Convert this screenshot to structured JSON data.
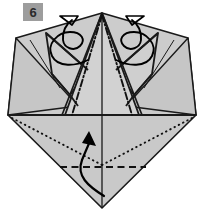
{
  "diagram": {
    "step_number": "6",
    "step_badge_color": "#9d9d9d",
    "paper_fill": "#c9c9c9",
    "paper_fill_light": "#d4d4d4",
    "paper_fill_dark": "#bdbdbd",
    "line_color": "#1a1a1a",
    "background": "#ffffff",
    "legend": {
      "mountain_fold": "dash-dot line",
      "valley_fold": "dashed line",
      "hidden_edge": "dotted line",
      "paper_edge": "solid line"
    },
    "annotations": [
      {
        "name": "curl-arrow-left",
        "type": "curved-arrow",
        "description": "Looping arrow at upper left indicating outward curl of left flap",
        "direction": "counter-clockwise-outward"
      },
      {
        "name": "curl-arrow-right",
        "type": "curved-arrow",
        "description": "Looping arrow at upper right indicating outward curl of right flap",
        "direction": "clockwise-outward"
      },
      {
        "name": "fold-up-arrow",
        "type": "curved-arrow",
        "description": "Curved arrow in lower diamond indicating fold bottom flap upward",
        "direction": "upward"
      }
    ],
    "fold_lines": [
      {
        "name": "center-vertical-line",
        "style": "solid"
      },
      {
        "name": "mountain-fold-left",
        "style": "dash-dot"
      },
      {
        "name": "mountain-fold-right",
        "style": "dash-dot"
      },
      {
        "name": "horizontal-midline",
        "style": "solid"
      },
      {
        "name": "valley-fold-horizontal",
        "style": "dashed"
      },
      {
        "name": "hidden-edge-left",
        "style": "dotted"
      },
      {
        "name": "hidden-edge-right",
        "style": "dotted"
      }
    ]
  }
}
